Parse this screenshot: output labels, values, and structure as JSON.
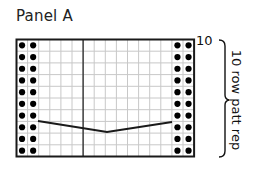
{
  "title": "Panel A",
  "row_number_label": "10",
  "repeat_label": "10 row patt rep",
  "grid": {
    "columns": 16,
    "rows": 10,
    "left": 16.5,
    "top": 39.5,
    "cell_w": 11.1,
    "cell_h": 11.7,
    "divider_after_column": 6,
    "dot_columns_left": [
      0,
      1
    ],
    "dot_columns_right": [
      14,
      15
    ],
    "dot_rows": "all",
    "line_points": [
      [
        38,
        121
      ],
      [
        107,
        132
      ],
      [
        172,
        122
      ]
    ]
  },
  "colors": {
    "grid_line": "#c8c8c8",
    "border": "#1a1a1a",
    "dot": "#000000",
    "stitch_line": "#1a1a1a"
  }
}
